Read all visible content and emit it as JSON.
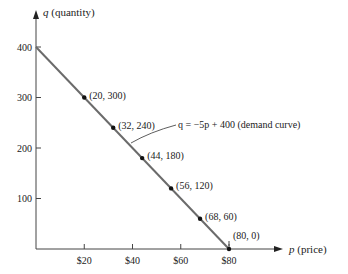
{
  "chart_data": {
    "type": "line",
    "title": "",
    "xlabel_var": "p",
    "xlabel_text": "(price)",
    "ylabel_var": "q",
    "ylabel_text": "(quantity)",
    "xlim": [
      0,
      80
    ],
    "ylim": [
      0,
      400
    ],
    "x_ticks": [
      20,
      40,
      60,
      80
    ],
    "x_tick_labels": [
      "$20",
      "$40",
      "$60",
      "$80"
    ],
    "y_ticks": [
      100,
      200,
      300,
      400
    ],
    "y_tick_labels": [
      "100",
      "200",
      "300",
      "400"
    ],
    "grid": false,
    "line": {
      "from": [
        0,
        400
      ],
      "to": [
        80,
        0
      ],
      "color": "#6b6b6b"
    },
    "points": [
      {
        "x": 20,
        "y": 300,
        "label": "(20, 300)"
      },
      {
        "x": 32,
        "y": 240,
        "label": "(32, 240)"
      },
      {
        "x": 44,
        "y": 180,
        "label": "(44, 180)"
      },
      {
        "x": 56,
        "y": 120,
        "label": "(56, 120)"
      },
      {
        "x": 68,
        "y": 60,
        "label": "(68, 60)"
      },
      {
        "x": 80,
        "y": 0,
        "label": "(80, 0)"
      }
    ],
    "annotation": "q = −5p + 400 (demand curve)"
  }
}
